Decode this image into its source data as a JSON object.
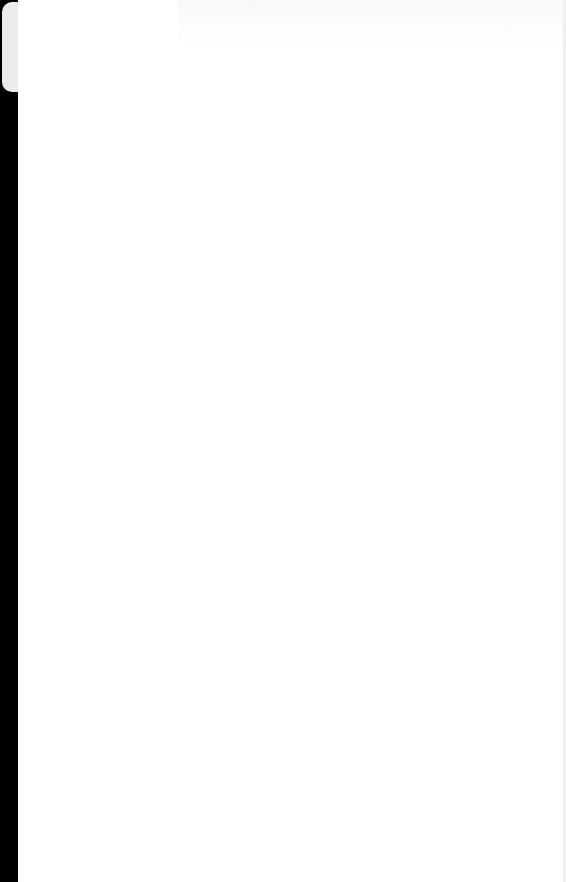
{
  "screen": {
    "state": "blank",
    "background_color": "#ffffff",
    "edge_color": "#000000"
  }
}
